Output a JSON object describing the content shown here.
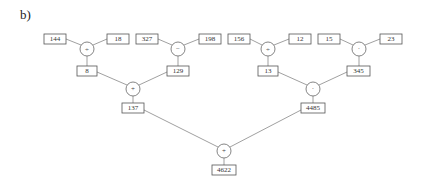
{
  "panel_label": "b)",
  "tree": {
    "leaves": [
      {
        "id": "n144",
        "value": "144"
      },
      {
        "id": "n18",
        "value": "18"
      },
      {
        "id": "n327",
        "value": "327"
      },
      {
        "id": "n198",
        "value": "198"
      },
      {
        "id": "n156",
        "value": "156"
      },
      {
        "id": "n12",
        "value": "12"
      },
      {
        "id": "n15",
        "value": "15"
      },
      {
        "id": "n23",
        "value": "23"
      }
    ],
    "level1_ops": [
      {
        "id": "op_div1",
        "symbol": "÷",
        "inputs": [
          "144",
          "18"
        ],
        "result": "8"
      },
      {
        "id": "op_sub1",
        "symbol": "−",
        "inputs": [
          "327",
          "198"
        ],
        "result": "129"
      },
      {
        "id": "op_div2",
        "symbol": "÷",
        "inputs": [
          "156",
          "12"
        ],
        "result": "13"
      },
      {
        "id": "op_mul1",
        "symbol": "·",
        "inputs": [
          "15",
          "23"
        ],
        "result": "345"
      }
    ],
    "level2_ops": [
      {
        "id": "op_add1",
        "symbol": "+",
        "inputs": [
          "8",
          "129"
        ],
        "result": "137"
      },
      {
        "id": "op_mul2",
        "symbol": "·",
        "inputs": [
          "13",
          "345"
        ],
        "result": "4485"
      }
    ],
    "root_op": {
      "id": "op_add_root",
      "symbol": "+",
      "inputs": [
        "137",
        "4485"
      ],
      "result": "4622"
    }
  }
}
